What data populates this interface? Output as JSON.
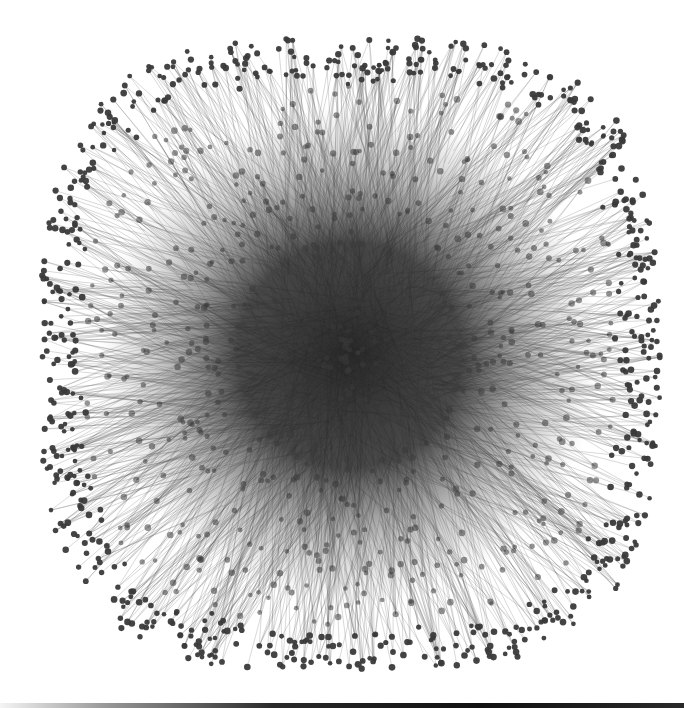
{
  "figure": {
    "type": "network-graph",
    "description": "Force-directed network graph (hairball) with a very dense dark core and radiating edges to peripheral nodes",
    "width": 684,
    "height": 708,
    "center": [
      350,
      355
    ],
    "extent": {
      "x": [
        40,
        660
      ],
      "y": [
        38,
        672
      ]
    },
    "shape": "rounded-square",
    "colors": {
      "background": "#ffffff",
      "node": "#3a3a3a",
      "core": "#1e1e1e",
      "edge": "#555555",
      "bottom_bar": "#1a1a1a"
    },
    "node_radius": 2.8,
    "node_count_drawn": 1400,
    "edge_count_drawn": 2600,
    "labels": []
  }
}
